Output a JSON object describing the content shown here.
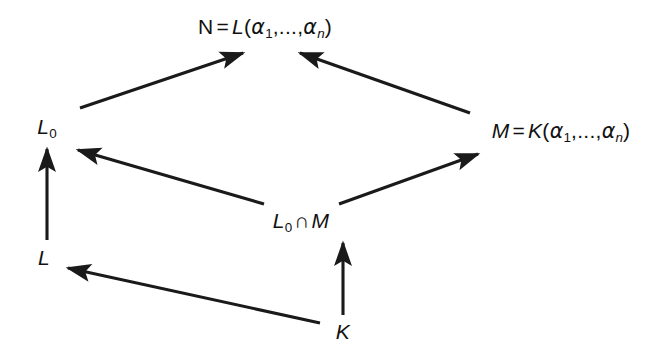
{
  "diagram": {
    "type": "field-extension-lattice",
    "background_color": "#ffffff",
    "stroke_color": "#1a1a1a",
    "nodes": [
      {
        "id": "N",
        "label": "N = L(α₁,...,αₙ)",
        "base": "N",
        "equals": "=",
        "field": "L",
        "open_paren": "(",
        "greek1": "α",
        "sub1": "1",
        "ellipsis": ",...,",
        "greek2": "α",
        "sub2": "n",
        "close_paren": ")",
        "x": 265,
        "y": 28
      },
      {
        "id": "L0",
        "label": "L₀",
        "base": "L",
        "sub1": "0",
        "x": 47,
        "y": 128
      },
      {
        "id": "M",
        "label": "M = K(α₁,...,αₙ)",
        "base": "M",
        "equals": "=",
        "field": "K",
        "open_paren": "(",
        "greek1": "α",
        "sub1": "1",
        "ellipsis": ",...,",
        "greek2": "α",
        "sub2": "n",
        "close_paren": ")",
        "x": 561,
        "y": 132
      },
      {
        "id": "L0_cap_M",
        "label": "L₀ ∩ M",
        "base": "L",
        "sub1": "0",
        "op": "∩",
        "second": "M",
        "x": 301,
        "y": 222
      },
      {
        "id": "L",
        "label": "L",
        "base": "L",
        "x": 44,
        "y": 258
      },
      {
        "id": "K",
        "label": "K",
        "base": "K",
        "x": 343,
        "y": 332
      }
    ],
    "edges": [
      {
        "from": "L0",
        "to": "N",
        "x1": 80,
        "y1": 108,
        "x2": 243,
        "y2": 53,
        "name": "edge-l0-to-n"
      },
      {
        "from": "M",
        "to": "N",
        "x1": 470,
        "y1": 113,
        "x2": 300,
        "y2": 53,
        "name": "edge-m-to-n"
      },
      {
        "from": "L0_cap_M",
        "to": "L0",
        "x1": 264,
        "y1": 204,
        "x2": 78,
        "y2": 150,
        "name": "edge-cap-to-l0"
      },
      {
        "from": "L0_cap_M",
        "to": "M",
        "x1": 339,
        "y1": 204,
        "x2": 478,
        "y2": 154,
        "name": "edge-cap-to-m"
      },
      {
        "from": "L",
        "to": "L0",
        "x1": 47,
        "y1": 240,
        "x2": 47,
        "y2": 149,
        "name": "edge-l-to-l0"
      },
      {
        "from": "K",
        "to": "L",
        "x1": 320,
        "y1": 323,
        "x2": 68,
        "y2": 268,
        "name": "edge-k-to-l"
      },
      {
        "from": "K",
        "to": "L0_cap_M",
        "x1": 343,
        "y1": 315,
        "x2": 343,
        "y2": 243,
        "name": "edge-k-to-cap"
      }
    ]
  }
}
